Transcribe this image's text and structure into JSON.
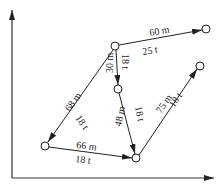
{
  "diagram": {
    "type": "directed-graph-on-axes",
    "axes": {
      "x_arrow": true,
      "y_arrow": true
    },
    "nodes": [
      {
        "id": "A",
        "x": 115,
        "y": 46
      },
      {
        "id": "B",
        "x": 206,
        "y": 29
      },
      {
        "id": "C",
        "x": 118,
        "y": 89
      },
      {
        "id": "D",
        "x": 200,
        "y": 66
      },
      {
        "id": "E",
        "x": 45,
        "y": 146
      },
      {
        "id": "F",
        "x": 136,
        "y": 158
      }
    ],
    "edges": [
      {
        "from": "A",
        "to": "B",
        "distance": "60 m",
        "load": "25 t"
      },
      {
        "from": "A",
        "to": "C",
        "distance": "30 m",
        "load": "18 t"
      },
      {
        "from": "A",
        "to": "E",
        "distance": "68 m",
        "load": "18 t"
      },
      {
        "from": "C",
        "to": "F",
        "distance": "48 m",
        "load": "18 t"
      },
      {
        "from": "E",
        "to": "F",
        "distance": "66 m",
        "load": "18 t"
      },
      {
        "from": "F",
        "to": "D",
        "distance": "75 m",
        "load": "18 t"
      }
    ]
  }
}
